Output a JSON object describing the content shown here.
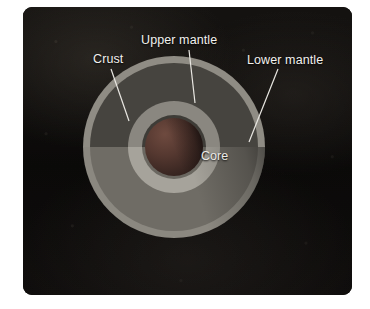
{
  "figure": {
    "background_color": "#ffffff",
    "panel_color": "#0d0c0b"
  },
  "labels": {
    "crust": "Crust",
    "upper_mantle": "Upper mantle",
    "lower_mantle": "Lower mantle",
    "core": "Core"
  },
  "layers": [
    {
      "name": "Crust",
      "color": "#8f8c84"
    },
    {
      "name": "Upper mantle",
      "color": "#46443f"
    },
    {
      "name": "Lower mantle",
      "color": "#8a8780"
    },
    {
      "name": "Core",
      "color": "#553830"
    }
  ],
  "leader_lines": {
    "crust": {
      "color": "#e9e7e2"
    },
    "upper_mantle": {
      "color": "#e9e7e2"
    },
    "lower_mantle": {
      "color": "#e9e7e2"
    }
  }
}
